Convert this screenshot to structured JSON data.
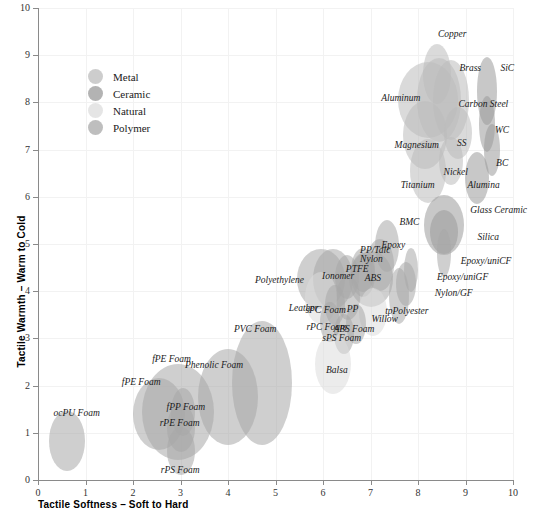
{
  "chart_data": {
    "type": "scatter",
    "title": "",
    "xlabel": "Tactile Softness – Soft to Hard",
    "ylabel": "Tactile Warmth – Warm to Cold",
    "xlim": [
      0,
      10
    ],
    "ylim": [
      0,
      10
    ],
    "xticks": [
      "0",
      "1",
      "2",
      "3",
      "4",
      "5",
      "6",
      "7",
      "8",
      "9",
      "10"
    ],
    "yticks": [
      "0",
      "1",
      "2",
      "3",
      "4",
      "5",
      "6",
      "7",
      "8",
      "9",
      "10"
    ],
    "grid": true,
    "legend_position": "upper-left",
    "legend": [
      {
        "label": "Metal",
        "color": "#bcbcbc"
      },
      {
        "label": "Ceramic",
        "color": "#9a9a9a"
      },
      {
        "label": "Natural",
        "color": "#dcdcdc"
      },
      {
        "label": "Polymer",
        "color": "#a8a8a8"
      }
    ],
    "colors": {
      "metal": "#bcbcbc",
      "ceramic": "#9a9a9a",
      "natural": "#dcdcdc",
      "polymer": "#a8a8a8",
      "axis": "#8a8a8a",
      "grid": "#f2f2f2",
      "text": "#1a1a1a"
    },
    "points": [
      {
        "name": "Copper",
        "group": "metal",
        "x": 8.4,
        "y": 8.6,
        "rx": 14,
        "ry": 30,
        "label_x": 8.72,
        "label_y": 9.42,
        "anchor": "middle"
      },
      {
        "name": "Brass",
        "group": "metal",
        "x": 8.45,
        "y": 8.05,
        "rx": 22,
        "ry": 42,
        "label_x": 9.1,
        "label_y": 8.7,
        "anchor": "middle"
      },
      {
        "name": "Aluminum",
        "group": "metal",
        "x": 8.2,
        "y": 8.05,
        "rx": 30,
        "ry": 38,
        "label_x": 8.05,
        "label_y": 8.08,
        "anchor": "end"
      },
      {
        "name": "Carbon Steel",
        "group": "metal",
        "x": 8.7,
        "y": 8.05,
        "rx": 18,
        "ry": 40,
        "label_x": 9.9,
        "label_y": 7.95,
        "anchor": "end"
      },
      {
        "name": "SiC",
        "group": "ceramic",
        "x": 9.45,
        "y": 8.25,
        "rx": 10,
        "ry": 34,
        "label_x": 9.88,
        "label_y": 8.7,
        "anchor": "middle"
      },
      {
        "name": "Magnesium",
        "group": "metal",
        "x": 8.15,
        "y": 7.3,
        "rx": 22,
        "ry": 34,
        "label_x": 8.44,
        "label_y": 7.08,
        "anchor": "end"
      },
      {
        "name": "SS",
        "group": "metal",
        "x": 8.85,
        "y": 7.35,
        "rx": 14,
        "ry": 26,
        "label_x": 8.92,
        "label_y": 7.12,
        "anchor": "middle"
      },
      {
        "name": "WC",
        "group": "ceramic",
        "x": 9.45,
        "y": 7.55,
        "rx": 8,
        "ry": 28,
        "label_x": 9.92,
        "label_y": 7.4,
        "anchor": "end"
      },
      {
        "name": "Nickel",
        "group": "metal",
        "x": 8.7,
        "y": 6.75,
        "rx": 12,
        "ry": 24,
        "label_x": 9.05,
        "label_y": 6.5,
        "anchor": "end"
      },
      {
        "name": "Titanium",
        "group": "metal",
        "x": 8.2,
        "y": 6.55,
        "rx": 18,
        "ry": 32,
        "label_x": 8.35,
        "label_y": 6.22,
        "anchor": "end"
      },
      {
        "name": "BC",
        "group": "ceramic",
        "x": 9.55,
        "y": 7.0,
        "rx": 8,
        "ry": 26,
        "label_x": 9.9,
        "label_y": 6.7,
        "anchor": "end"
      },
      {
        "name": "Alumina",
        "group": "ceramic",
        "x": 9.25,
        "y": 6.4,
        "rx": 12,
        "ry": 26,
        "label_x": 9.72,
        "label_y": 6.22,
        "anchor": "end"
      },
      {
        "name": "Glass Ceramic",
        "group": "ceramic",
        "x": 8.55,
        "y": 5.4,
        "rx": 20,
        "ry": 30,
        "label_x": 9.1,
        "label_y": 5.7,
        "anchor": "start"
      },
      {
        "name": "Silica",
        "group": "ceramic",
        "x": 8.55,
        "y": 5.25,
        "rx": 14,
        "ry": 22,
        "label_x": 9.25,
        "label_y": 5.12,
        "anchor": "start"
      },
      {
        "name": "Epoxy/uniCF",
        "group": "polymer",
        "x": 8.55,
        "y": 4.8,
        "rx": 7,
        "ry": 24,
        "label_x": 8.9,
        "label_y": 4.62,
        "anchor": "start"
      },
      {
        "name": "Epoxy/uniGF",
        "group": "polymer",
        "x": 7.85,
        "y": 4.45,
        "rx": 7,
        "ry": 22,
        "label_x": 8.4,
        "label_y": 4.28,
        "anchor": "start"
      },
      {
        "name": "Nylon/GF",
        "group": "polymer",
        "x": 7.75,
        "y": 4.15,
        "rx": 10,
        "ry": 22,
        "label_x": 8.35,
        "label_y": 3.95,
        "anchor": "start"
      },
      {
        "name": "BMC",
        "group": "polymer",
        "x": 7.35,
        "y": 4.95,
        "rx": 12,
        "ry": 26,
        "label_x": 7.82,
        "label_y": 5.45,
        "anchor": "middle"
      },
      {
        "name": "Epoxy",
        "group": "polymer",
        "x": 7.2,
        "y": 4.55,
        "rx": 14,
        "ry": 26,
        "label_x": 7.48,
        "label_y": 4.95,
        "anchor": "middle"
      },
      {
        "name": "tpPolyester",
        "group": "polymer",
        "x": 7.6,
        "y": 3.9,
        "rx": 10,
        "ry": 28,
        "label_x": 8.22,
        "label_y": 3.55,
        "anchor": "end"
      },
      {
        "name": "PP/Talc",
        "group": "polymer",
        "x": 6.85,
        "y": 4.45,
        "rx": 12,
        "ry": 22,
        "label_x": 7.1,
        "label_y": 4.85,
        "anchor": "middle"
      },
      {
        "name": "Nylon",
        "group": "polymer",
        "x": 6.85,
        "y": 4.35,
        "rx": 12,
        "ry": 22,
        "label_x": 7.02,
        "label_y": 4.66,
        "anchor": "middle"
      },
      {
        "name": "ABS",
        "group": "polymer",
        "x": 7.0,
        "y": 4.25,
        "rx": 22,
        "ry": 28,
        "label_x": 7.05,
        "label_y": 4.25,
        "anchor": "middle"
      },
      {
        "name": "PTFE",
        "group": "polymer",
        "x": 6.5,
        "y": 4.3,
        "rx": 12,
        "ry": 22,
        "label_x": 6.72,
        "label_y": 4.45,
        "anchor": "middle"
      },
      {
        "name": "Ionomer",
        "group": "polymer",
        "x": 6.2,
        "y": 4.25,
        "rx": 20,
        "ry": 30,
        "label_x": 6.32,
        "label_y": 4.3,
        "anchor": "middle"
      },
      {
        "name": "Polyethylene",
        "group": "polymer",
        "x": 5.95,
        "y": 4.25,
        "rx": 24,
        "ry": 30,
        "label_x": 5.6,
        "label_y": 4.22,
        "anchor": "end"
      },
      {
        "name": "PP",
        "group": "polymer",
        "x": 6.52,
        "y": 3.85,
        "rx": 12,
        "ry": 22,
        "label_x": 6.62,
        "label_y": 3.6,
        "anchor": "middle"
      },
      {
        "name": "Willow",
        "group": "natural",
        "x": 7.05,
        "y": 3.55,
        "rx": 14,
        "ry": 24,
        "label_x": 7.3,
        "label_y": 3.38,
        "anchor": "middle"
      },
      {
        "name": "Leather",
        "group": "natural",
        "x": 5.95,
        "y": 3.85,
        "rx": 16,
        "ry": 26,
        "label_x": 5.9,
        "label_y": 3.62,
        "anchor": "end"
      },
      {
        "name": "sPC Foam",
        "group": "polymer",
        "x": 6.25,
        "y": 3.7,
        "rx": 10,
        "ry": 20,
        "label_x": 6.48,
        "label_y": 3.58,
        "anchor": "end"
      },
      {
        "name": "rPC Foam",
        "group": "polymer",
        "x": 6.15,
        "y": 3.35,
        "rx": 10,
        "ry": 20,
        "label_x": 6.5,
        "label_y": 3.22,
        "anchor": "end"
      },
      {
        "name": "ABS Foam",
        "group": "polymer",
        "x": 6.7,
        "y": 3.3,
        "rx": 10,
        "ry": 20,
        "label_x": 7.08,
        "label_y": 3.18,
        "anchor": "end"
      },
      {
        "name": "sPS Foam",
        "group": "polymer",
        "x": 6.45,
        "y": 3.1,
        "rx": 10,
        "ry": 20,
        "label_x": 6.8,
        "label_y": 2.98,
        "anchor": "end"
      },
      {
        "name": "Balsa",
        "group": "natural",
        "x": 6.2,
        "y": 2.45,
        "rx": 18,
        "ry": 30,
        "label_x": 6.52,
        "label_y": 2.3,
        "anchor": "end"
      },
      {
        "name": "PVC Foam",
        "group": "polymer",
        "x": 4.72,
        "y": 2.05,
        "rx": 30,
        "ry": 62,
        "label_x": 5.02,
        "label_y": 3.18,
        "anchor": "end"
      },
      {
        "name": "Phenolic Foam",
        "group": "polymer",
        "x": 4.0,
        "y": 1.75,
        "rx": 30,
        "ry": 48,
        "label_x": 4.32,
        "label_y": 2.42,
        "anchor": "end"
      },
      {
        "name": "fPE Foam",
        "group": "polymer",
        "x": 2.95,
        "y": 1.45,
        "rx": 36,
        "ry": 48,
        "label_x": 3.22,
        "label_y": 2.55,
        "anchor": "end"
      },
      {
        "name": "fPE Foam ",
        "group": "polymer",
        "x": 2.55,
        "y": 1.4,
        "rx": 26,
        "ry": 36,
        "label_x": 2.58,
        "label_y": 2.05,
        "anchor": "end"
      },
      {
        "name": "fPP Foam",
        "group": "polymer",
        "x": 3.05,
        "y": 1.45,
        "rx": 12,
        "ry": 24,
        "label_x": 3.52,
        "label_y": 1.52,
        "anchor": "end"
      },
      {
        "name": "rPE Foam",
        "group": "polymer",
        "x": 3.0,
        "y": 1.1,
        "rx": 14,
        "ry": 24,
        "label_x": 3.4,
        "label_y": 1.18,
        "anchor": "end"
      },
      {
        "name": "rPS Foam",
        "group": "polymer",
        "x": 3.0,
        "y": 0.62,
        "rx": 14,
        "ry": 24,
        "label_x": 3.4,
        "label_y": 0.2,
        "anchor": "end"
      },
      {
        "name": "ocPU Foam",
        "group": "polymer",
        "x": 0.62,
        "y": 0.82,
        "rx": 18,
        "ry": 30,
        "label_x": 1.3,
        "label_y": 1.4,
        "anchor": "end"
      }
    ]
  }
}
